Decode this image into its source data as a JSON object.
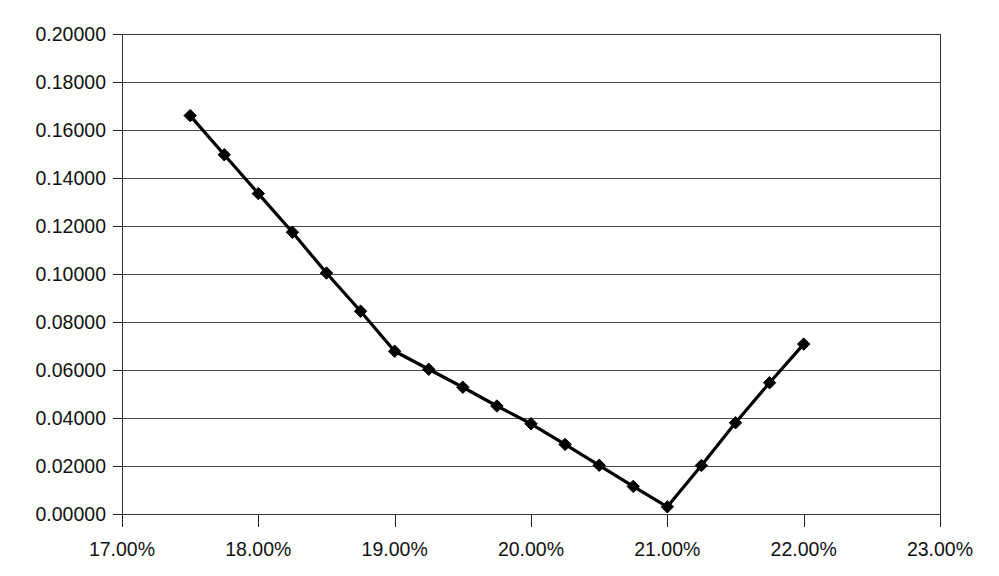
{
  "chart_data": {
    "type": "line",
    "title": "",
    "subtitle": "",
    "xlabel": "",
    "ylabel": "",
    "x": [
      17.5,
      17.75,
      18.0,
      18.25,
      18.5,
      18.75,
      19.0,
      19.25,
      19.5,
      19.75,
      20.0,
      20.25,
      20.5,
      20.75,
      21.0,
      21.25,
      21.5,
      21.75,
      22.0
    ],
    "values": [
      0.166,
      0.1497,
      0.1335,
      0.1174,
      0.1004,
      0.0845,
      0.0678,
      0.0603,
      0.0528,
      0.045,
      0.0376,
      0.029,
      0.0203,
      0.0115,
      0.003,
      0.0202,
      0.038,
      0.0547,
      0.0708
    ],
    "series": [
      {
        "name": "series-1",
        "values": [
          0.166,
          0.1497,
          0.1335,
          0.1174,
          0.1004,
          0.0845,
          0.0678,
          0.0603,
          0.0528,
          0.045,
          0.0376,
          0.029,
          0.0203,
          0.0115,
          0.003,
          0.0202,
          0.038,
          0.0547,
          0.0708
        ]
      }
    ],
    "xlim": [
      17.0,
      23.0
    ],
    "ylim": [
      0.0,
      0.2
    ],
    "xticks": [
      17.0,
      18.0,
      19.0,
      20.0,
      21.0,
      22.0,
      23.0
    ],
    "yticks": [
      0.0,
      0.02,
      0.04,
      0.06,
      0.08,
      0.1,
      0.12,
      0.14,
      0.16,
      0.18,
      0.2
    ],
    "xtick_labels": [
      "17.00%",
      "18.00%",
      "19.00%",
      "20.00%",
      "21.00%",
      "22.00%",
      "23.00%"
    ],
    "ytick_labels": [
      "0.00000",
      "0.02000",
      "0.04000",
      "0.06000",
      "0.08000",
      "0.10000",
      "0.12000",
      "0.14000",
      "0.16000",
      "0.18000",
      "0.20000"
    ],
    "grid": true,
    "grid_axis": "y",
    "legend": false,
    "legend_position": "none",
    "marker": "diamond",
    "annotations": []
  },
  "style": {
    "background_color": "#ffffff",
    "line_color": "#000000",
    "marker_color": "#000000",
    "grid_color": "#4a4a4a",
    "axis_color": "#222222",
    "text_color": "#111111"
  },
  "geometry": {
    "plot_left": 122,
    "plot_right": 940,
    "plot_top": 34,
    "plot_bottom": 514
  }
}
